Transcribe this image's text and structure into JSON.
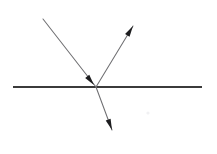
{
  "figure": {
    "kind": "ray-diagram",
    "title": "",
    "background_color": "#ffffff",
    "width": 217,
    "height": 154
  },
  "colors": {
    "surface_line": "#3b3b3b",
    "ray_line": "#6f6f72",
    "arrow_fill": "#1d1d1f",
    "speck": "#f1f1f3"
  },
  "strokes": {
    "surface_width": "2.1",
    "ray_width": "1.05"
  },
  "geometry": {
    "intersection": {
      "x": 96,
      "y": 87
    },
    "surface": {
      "x1": 13,
      "y1": 87,
      "x2": 202,
      "y2": 87
    },
    "incident_ray": {
      "x1": 43,
      "y1": 19,
      "x2": 96,
      "y2": 87
    },
    "reflected_ray": {
      "x1": 96,
      "y1": 87,
      "x2": 133,
      "y2": 26
    },
    "transmitted_ray": {
      "x1": 96,
      "y1": 87,
      "x2": 112,
      "y2": 130
    }
  },
  "arrowheads": {
    "incident": {
      "tip_x": 94,
      "tip_y": 85,
      "angle_deg": 52,
      "length": 11,
      "half_width": 2.6
    },
    "reflected": {
      "tip_x": 133,
      "tip_y": 26,
      "angle_deg": -58.8,
      "length": 11,
      "half_width": 2.6
    },
    "transmitted": {
      "tip_x": 112,
      "tip_y": 130,
      "angle_deg": 69.6,
      "length": 11,
      "half_width": 2.6
    }
  },
  "artifacts": {
    "speck": {
      "x": 148,
      "y": 113,
      "r": 1.6
    }
  },
  "labels": []
}
